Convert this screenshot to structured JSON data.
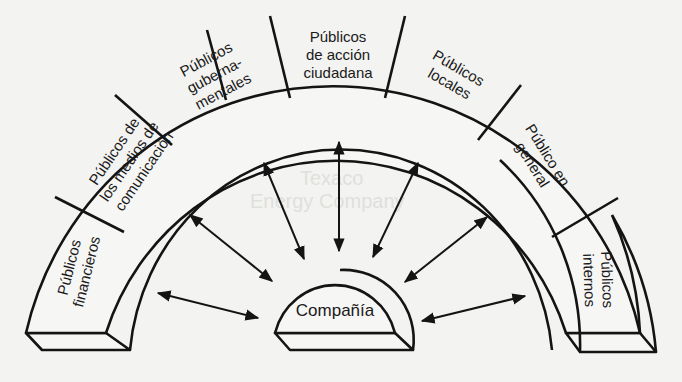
{
  "diagram": {
    "center_label": "Compañía",
    "segments": [
      {
        "id": "financieros",
        "lines": [
          "Públicos",
          "financieros"
        ]
      },
      {
        "id": "medios",
        "lines": [
          "Públicos de",
          "los medios de",
          "comunicación"
        ]
      },
      {
        "id": "gubernamentales",
        "lines": [
          "Públicos",
          "guberna-",
          "mentales"
        ]
      },
      {
        "id": "accion-ciudadana",
        "lines": [
          "Públicos",
          "de acción",
          "ciudadana"
        ]
      },
      {
        "id": "locales",
        "lines": [
          "Públicos",
          "locales"
        ]
      },
      {
        "id": "general",
        "lines": [
          "Público en",
          "general"
        ]
      },
      {
        "id": "internos",
        "lines": [
          "Públicos",
          "internos"
        ]
      }
    ],
    "arrow_count": 9,
    "colors": {
      "line": "#141414",
      "paper": "#f3f3f1"
    }
  }
}
